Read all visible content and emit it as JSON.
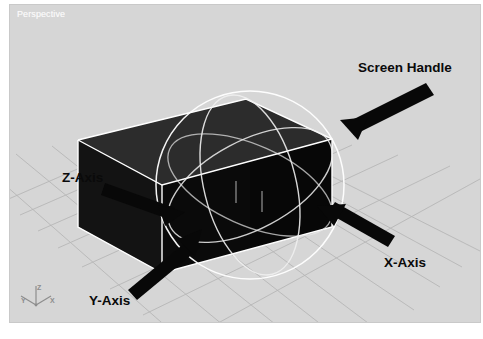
{
  "viewport": {
    "label": "Perspective",
    "background_color": "#d6d6d6",
    "grid_color": "#b4b4b4"
  },
  "object": {
    "name": "box",
    "top_face_color": "#2c2c2c",
    "left_face_color": "#131313",
    "front_face_color": "#070707",
    "wireframe_color": "#ffffff"
  },
  "gizmo": {
    "name": "rotate-manipulator",
    "ring_color": "#f2f2f2",
    "screen_handle_color": "#ffffff"
  },
  "callouts": [
    {
      "id": "screen-handle",
      "label": "Screen Handle"
    },
    {
      "id": "z-axis",
      "label": "Z-Axis"
    },
    {
      "id": "x-axis",
      "label": "X-Axis"
    },
    {
      "id": "y-axis",
      "label": "Y-Axis"
    }
  ],
  "axis_indicator": {
    "name": "view-axis-gizmo",
    "z": "Z",
    "y": "Y",
    "x": "X",
    "color": "#8d8d8d"
  }
}
